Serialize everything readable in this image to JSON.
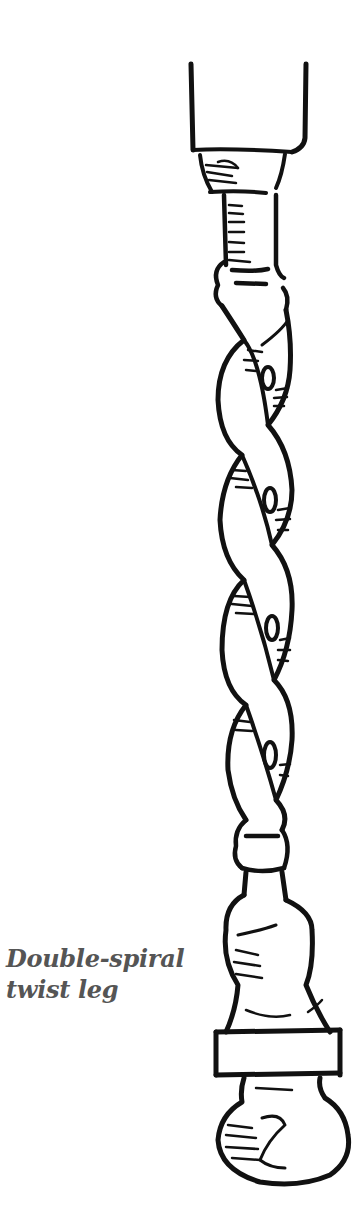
{
  "figure": {
    "caption": {
      "line1": "Double-spiral",
      "line2": "twist leg"
    },
    "colors": {
      "ink": "#111111",
      "caption": "#555555",
      "background": "#ffffff"
    }
  }
}
